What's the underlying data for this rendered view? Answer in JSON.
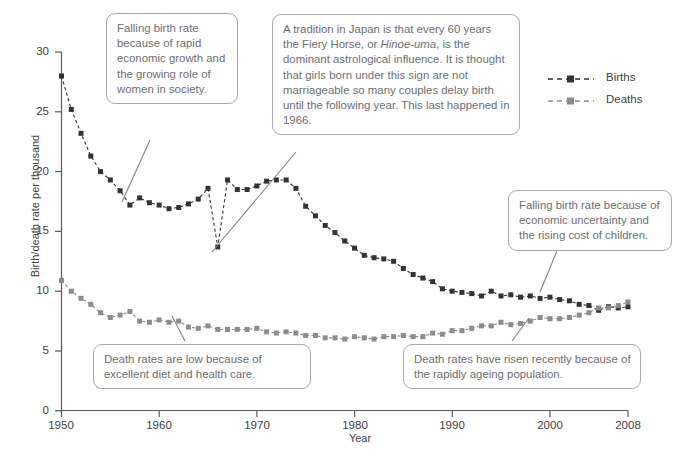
{
  "chart_data": {
    "type": "line",
    "title": "",
    "xlabel": "Year",
    "ylabel": "Birth/death rate per thousand",
    "xlim": [
      1950,
      2008
    ],
    "ylim": [
      0,
      30
    ],
    "xticks": [
      1950,
      1960,
      1970,
      1980,
      1990,
      2000,
      2008
    ],
    "yticks": [
      0,
      5,
      10,
      15,
      20,
      25,
      30
    ],
    "grid": false,
    "legend_position": "top-right",
    "x": [
      1950,
      1951,
      1952,
      1953,
      1954,
      1955,
      1956,
      1957,
      1958,
      1959,
      1960,
      1961,
      1962,
      1963,
      1964,
      1965,
      1966,
      1967,
      1968,
      1969,
      1970,
      1971,
      1972,
      1973,
      1974,
      1975,
      1976,
      1977,
      1978,
      1979,
      1980,
      1981,
      1982,
      1983,
      1984,
      1985,
      1986,
      1987,
      1988,
      1989,
      1990,
      1991,
      1992,
      1993,
      1994,
      1995,
      1996,
      1997,
      1998,
      1999,
      2000,
      2001,
      2002,
      2003,
      2004,
      2005,
      2006,
      2007,
      2008
    ],
    "series": [
      {
        "name": "Births",
        "color": "#333333",
        "marker": "square",
        "linestyle": "dashed",
        "values": [
          28.0,
          25.2,
          23.2,
          21.3,
          20.0,
          19.3,
          18.4,
          17.2,
          17.8,
          17.4,
          17.2,
          16.9,
          17.0,
          17.3,
          17.7,
          18.6,
          13.7,
          19.3,
          18.5,
          18.5,
          18.8,
          19.2,
          19.3,
          19.3,
          18.6,
          17.1,
          16.3,
          15.5,
          14.9,
          14.2,
          13.6,
          13.0,
          12.8,
          12.7,
          12.5,
          11.9,
          11.4,
          11.1,
          10.8,
          10.2,
          10.0,
          9.9,
          9.8,
          9.6,
          10.0,
          9.6,
          9.7,
          9.5,
          9.6,
          9.4,
          9.5,
          9.3,
          9.2,
          8.9,
          8.8,
          8.4,
          8.7,
          8.6,
          8.7
        ]
      },
      {
        "name": "Deaths",
        "color": "#8c8c8c",
        "marker": "square",
        "linestyle": "dashed",
        "values": [
          10.9,
          10.0,
          9.4,
          8.9,
          8.2,
          7.8,
          8.0,
          8.3,
          7.5,
          7.4,
          7.6,
          7.4,
          7.5,
          7.0,
          6.9,
          7.1,
          6.8,
          6.8,
          6.8,
          6.8,
          6.9,
          6.6,
          6.5,
          6.6,
          6.5,
          6.3,
          6.3,
          6.1,
          6.1,
          6.0,
          6.2,
          6.1,
          6.0,
          6.2,
          6.2,
          6.3,
          6.2,
          6.2,
          6.5,
          6.4,
          6.7,
          6.7,
          6.9,
          7.1,
          7.1,
          7.4,
          7.2,
          7.3,
          7.5,
          7.8,
          7.7,
          7.7,
          7.8,
          8.0,
          8.2,
          8.6,
          8.6,
          8.8,
          9.1
        ]
      }
    ]
  },
  "legend": {
    "items": [
      {
        "label": "Births"
      },
      {
        "label": "Deaths"
      }
    ]
  },
  "axes": {
    "y_title": "Birth/death rate per thousand",
    "x_title": "Year",
    "y_ticks": [
      "30",
      "25",
      "20",
      "15",
      "10",
      "5",
      "0"
    ],
    "x_ticks": [
      "1950",
      "1960",
      "1970",
      "1980",
      "1990",
      "2000",
      "2008"
    ]
  },
  "annotations": {
    "birth_growth": "Falling birth rate because of rapid economic growth and the growing role of women in society.",
    "hinoe_uma_pre": "A tradition in Japan is that every 60 years the Fiery Horse, or ",
    "hinoe_uma_italic": "Hinoe-uma",
    "hinoe_uma_post": ", is the dominant astrological influence. It is thought that girls born under this sign are not marriageable so many couples delay birth until the following year. This last happened in 1966.",
    "birth_falling": "Falling birth rate because of economic uncertainty and the rising cost of children.",
    "death_low": "Death rates are low because of excellent diet and health care.",
    "death_risen": "Death rates have risen recently because of the rapidly ageing population."
  }
}
